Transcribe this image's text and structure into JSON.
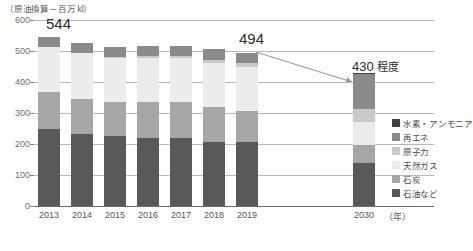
{
  "chart_data": {
    "type": "bar",
    "title": "",
    "subtitle": "",
    "ylabel": "（原油換算－百万 kl）",
    "xlabel": "（年）",
    "ylim": [
      0,
      600
    ],
    "yticks": [
      0,
      100,
      200,
      300,
      400,
      500,
      600
    ],
    "grid": true,
    "stacked": true,
    "legend_position": "right",
    "categories": [
      "2013",
      "2014",
      "2015",
      "2016",
      "2017",
      "2018",
      "2019",
      "2030"
    ],
    "series": [
      {
        "name": "石油など",
        "color": "#595959",
        "values": [
          247,
          231,
          225,
          219,
          219,
          208,
          205,
          139
        ]
      },
      {
        "name": "石炭",
        "color": "#a6a6a6",
        "values": [
          120,
          113,
          112,
          117,
          117,
          112,
          102,
          57
        ]
      },
      {
        "name": "天然ガス",
        "color": "#ececec",
        "values": [
          145,
          149,
          141,
          143,
          140,
          141,
          140,
          75
        ]
      },
      {
        "name": "原子力",
        "color": "#c9c9c9",
        "values": [
          0,
          1,
          2,
          4,
          7,
          11,
          13,
          43
        ]
      },
      {
        "name": "再エネ",
        "color": "#8a8a8a",
        "values": [
          32,
          32,
          33,
          32,
          33,
          34,
          34,
          111
        ]
      },
      {
        "name": "水素・アンモニア",
        "color": "#404040",
        "values": [
          0,
          0,
          0,
          0,
          0,
          0,
          0,
          5
        ]
      }
    ],
    "annotations": [
      {
        "text": "544",
        "category": "2013",
        "value": 544
      },
      {
        "text": "494",
        "category": "2019",
        "value": 494
      },
      {
        "text": "430",
        "suffix": " 程度",
        "category": "2030",
        "value": 430
      }
    ],
    "totals": [
      544,
      526,
      513,
      515,
      516,
      506,
      494,
      430
    ]
  },
  "legend": {
    "items": [
      {
        "label": "水素・アンモニア",
        "color": "#404040"
      },
      {
        "label": "再エネ",
        "color": "#8a8a8a"
      },
      {
        "label": "原子力",
        "color": "#c9c9c9"
      },
      {
        "label": "天然ガス",
        "color": "#ececec"
      },
      {
        "label": "石炭",
        "color": "#a6a6a6"
      },
      {
        "label": "石油など",
        "color": "#595959"
      }
    ]
  },
  "axis": {
    "y_title": "（原油換算－百万 kl）",
    "x_unit": "（年）",
    "ticks": [
      "600",
      "500",
      "400",
      "300",
      "200",
      "100",
      "0"
    ],
    "x_labels": [
      "2013",
      "2014",
      "2015",
      "2016",
      "2017",
      "2018",
      "2019",
      "2030"
    ]
  },
  "callouts": {
    "first": "544",
    "latest": "494",
    "target_value": "430",
    "target_suffix": " 程度"
  },
  "colors": {
    "grid": "#b9b9b9",
    "axis": "#6b6b6b",
    "text": "#4a4a4a",
    "arrow": "#9a9a9a"
  }
}
